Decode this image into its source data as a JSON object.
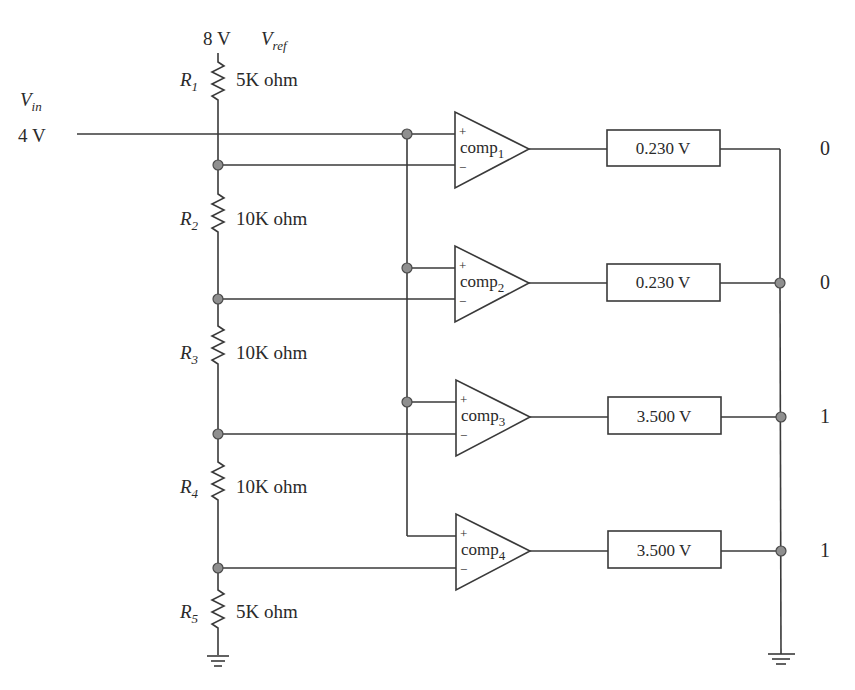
{
  "diagram": {
    "vref": {
      "value": "8 V",
      "symbol": "V",
      "symbol_sub": "ref"
    },
    "vin": {
      "symbol": "V",
      "symbol_sub": "in",
      "value": "4 V"
    },
    "resistors": [
      {
        "name": "R",
        "sub": "1",
        "value": "5K ohm"
      },
      {
        "name": "R",
        "sub": "2",
        "value": "10K ohm"
      },
      {
        "name": "R",
        "sub": "3",
        "value": "10K ohm"
      },
      {
        "name": "R",
        "sub": "4",
        "value": "10K ohm"
      },
      {
        "name": "R",
        "sub": "5",
        "value": "5K ohm"
      }
    ],
    "comparators": [
      {
        "name": "comp",
        "sub": "1",
        "plus": "+",
        "minus": "−",
        "output_voltage": "0.230 V",
        "bit": "0"
      },
      {
        "name": "comp",
        "sub": "2",
        "plus": "+",
        "minus": "−",
        "output_voltage": "0.230 V",
        "bit": "0"
      },
      {
        "name": "comp",
        "sub": "3",
        "plus": "+",
        "minus": "−",
        "output_voltage": "3.500 V",
        "bit": "1"
      },
      {
        "name": "comp",
        "sub": "4",
        "plus": "+",
        "minus": "−",
        "output_voltage": "3.500 V",
        "bit": "1"
      }
    ],
    "colors": {
      "wire": "#3a3a3a",
      "node_fill": "#8f8f8f",
      "background": "#ffffff"
    }
  }
}
